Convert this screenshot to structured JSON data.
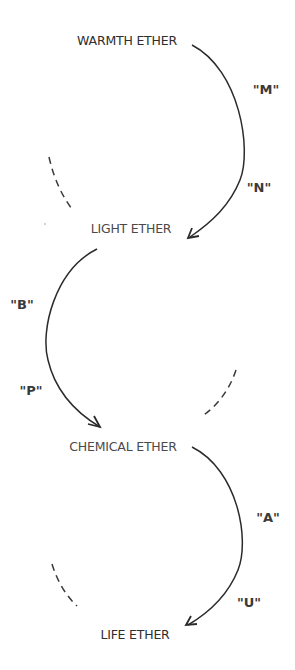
{
  "diagram": {
    "nodes": [
      {
        "id": "warmth",
        "label": "WARMTH ETHER"
      },
      {
        "id": "light",
        "label": "LIGHT ETHER"
      },
      {
        "id": "chemical",
        "label": "CHEMICAL ETHER"
      },
      {
        "id": "life",
        "label": "LIFE ETHER"
      }
    ],
    "transitions": [
      {
        "from": "warmth",
        "to": "light",
        "side": "right",
        "labels": [
          "\"M\"",
          "\"N\""
        ]
      },
      {
        "from": "light",
        "to": "chemical",
        "side": "left",
        "labels": [
          "\"B\"",
          "\"P\""
        ]
      },
      {
        "from": "chemical",
        "to": "life",
        "side": "right",
        "labels": [
          "\"A\"",
          "\"U\""
        ]
      }
    ],
    "dashed_return_arcs": [
      {
        "near": "warmth-light",
        "side": "left"
      },
      {
        "near": "light-chemical",
        "side": "right"
      },
      {
        "near": "chemical-life",
        "side": "left"
      }
    ],
    "colors": {
      "line": "#2b2b2b",
      "text": "#2e2e2e",
      "background": "#ffffff"
    }
  }
}
